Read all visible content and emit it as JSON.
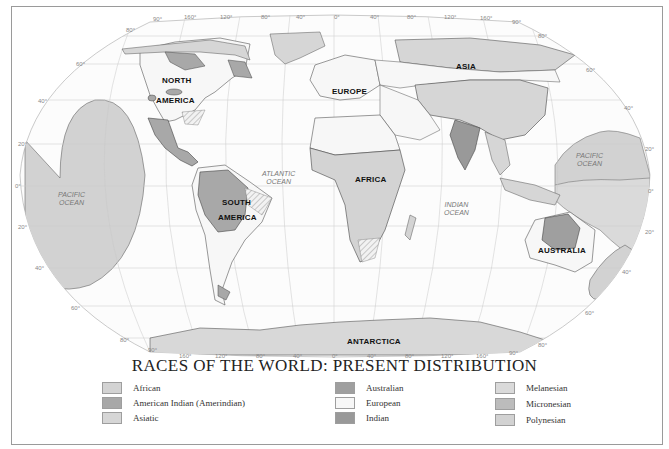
{
  "title": "RACES OF THE WORLD: PRESENT DISTRIBUTION",
  "colors": {
    "african": "#d3d3d3",
    "american_indian": "#a8a8a8",
    "asiatic": "#d6d6d6",
    "australian": "#9f9f9f",
    "european": "#f7f7f7",
    "indian": "#999999",
    "melanesian": "#dadada",
    "micronesian": "#bcbcbc",
    "polynesian": "#d2d2d2",
    "graticule": "#b5b5b5",
    "coast": "#555555"
  },
  "continents": {
    "north_america": [
      "NORTH",
      "AMERICA"
    ],
    "south_america": [
      "SOUTH",
      "AMERICA"
    ],
    "europe": "EUROPE",
    "asia": "ASIA",
    "africa": "AFRICA",
    "australia": "AUSTRALIA",
    "antarctica": "ANTARCTICA"
  },
  "oceans": {
    "pacific_west": [
      "PACIFIC",
      "OCEAN"
    ],
    "pacific_east": [
      "PACIFIC",
      "OCEAN"
    ],
    "atlantic": [
      "ATLANTIC",
      "OCEAN"
    ],
    "indian": [
      "INDIAN",
      "OCEAN"
    ]
  },
  "longitude_ticks_top": [
    "90°",
    "160°",
    "120°",
    "80°",
    "40°",
    "0°",
    "40°",
    "80°",
    "120°",
    "160°",
    "90°"
  ],
  "longitude_ticks_bottom": [
    "90°",
    "160°",
    "120°",
    "80°",
    "40°",
    "0°",
    "40°",
    "80°",
    "120°",
    "160°",
    "90°"
  ],
  "latitude_ticks_left": [
    "80°",
    "60°",
    "40°",
    "20°",
    "0°",
    "20°",
    "40°",
    "60°",
    "80°"
  ],
  "latitude_ticks_right": [
    "80°",
    "60°",
    "40°",
    "20°",
    "0°",
    "20°",
    "40°",
    "60°",
    "80°"
  ],
  "legend": {
    "columns": [
      [
        {
          "label": "African",
          "key": "african"
        },
        {
          "label": "American Indian (Amerindian)",
          "key": "american_indian"
        },
        {
          "label": "Asiatic",
          "key": "asiatic"
        }
      ],
      [
        {
          "label": "Australian",
          "key": "australian"
        },
        {
          "label": "European",
          "key": "european"
        },
        {
          "label": "Indian",
          "key": "indian"
        }
      ],
      [
        {
          "label": "Melanesian",
          "key": "melanesian"
        },
        {
          "label": "Micronesian",
          "key": "micronesian"
        },
        {
          "label": "Polynesian",
          "key": "polynesian"
        }
      ]
    ]
  }
}
